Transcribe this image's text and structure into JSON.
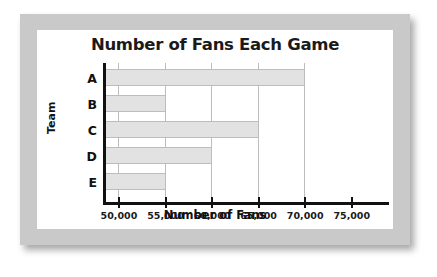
{
  "chart_data": {
    "type": "bar",
    "orientation": "horizontal",
    "title": "Number of Fans Each Game",
    "xlabel": "Number of Fans",
    "ylabel": "Team",
    "categories": [
      "A",
      "B",
      "C",
      "D",
      "E"
    ],
    "values": [
      70000,
      55000,
      65000,
      60000,
      55000
    ],
    "xlim": [
      48500,
      79000
    ],
    "xticks": [
      50000,
      55000,
      60000,
      65000,
      70000,
      75000
    ],
    "xtick_labels": [
      "50,000",
      "55,000",
      "60,000",
      "65,000",
      "70,000",
      "75,000"
    ],
    "grid": true,
    "legend": false,
    "colors": {
      "bar_fill": "#e2e2e2",
      "bar_border": "#bdbdbd",
      "axis": "#111111",
      "gridline": "#bdbdbd",
      "text": "#1a1a1a",
      "frame": "#c9c9c9",
      "plot_background": "#ffffff"
    }
  }
}
